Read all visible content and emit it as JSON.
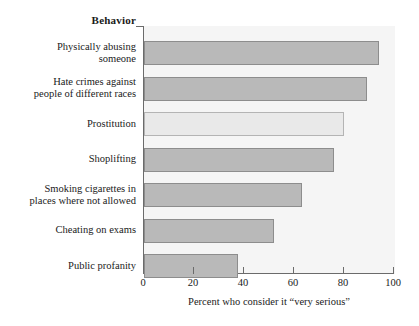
{
  "chart_data": {
    "type": "bar",
    "orientation": "horizontal",
    "title": "",
    "category_axis_title": "Behavior",
    "xlabel": "Percent who consider it “very serious”",
    "ylabel": "Behavior",
    "xlim": [
      0,
      100
    ],
    "xticks": [
      0,
      20,
      40,
      60,
      80,
      100
    ],
    "xtick_labels": [
      "0",
      "20",
      "40",
      "60",
      "80",
      "100"
    ],
    "grid": false,
    "legend": "none",
    "categories": [
      "Physically abusing someone",
      "Hate crimes against people of different races",
      "Prostitution",
      "Shoplifting",
      "Smoking cigarettes in places where not allowed",
      "Cheating on exams",
      "Public profanity"
    ],
    "category_lines": [
      [
        "Physically abusing",
        "someone"
      ],
      [
        "Hate crimes against",
        "people of different races"
      ],
      [
        "Prostitution",
        ""
      ],
      [
        "Shoplifting",
        ""
      ],
      [
        "Smoking cigarettes in",
        "places where not allowed"
      ],
      [
        "Cheating on exams",
        ""
      ],
      [
        "Public profanity",
        ""
      ]
    ],
    "values": [
      94,
      89,
      80,
      76,
      63,
      52,
      37.5
    ],
    "bar_colors": [
      "#b9b9b9",
      "#b9b9b9",
      "#e9e9e9",
      "#b9b9b9",
      "#b9b9b9",
      "#b9b9b9",
      "#b9b9b9"
    ],
    "bar_border_color": "#8d8d8d",
    "plot_background": "#f5f5f5",
    "axis_color": "#6b6b6b"
  },
  "axis": {
    "behavior_label": "Behavior",
    "x_title": "Percent who consider it “very serious”",
    "ticks": [
      "0",
      "20",
      "40",
      "60",
      "80",
      "100"
    ]
  },
  "rows": [
    {
      "line1": "Physically abusing",
      "line2": "someone",
      "value": 94
    },
    {
      "line1": "Hate crimes against",
      "line2": "people of different races",
      "value": 89
    },
    {
      "line1": "Prostitution",
      "line2": "",
      "value": 80
    },
    {
      "line1": "Shoplifting",
      "line2": "",
      "value": 76
    },
    {
      "line1": "Smoking cigarettes in",
      "line2": "places where not allowed",
      "value": 63
    },
    {
      "line1": "Cheating on exams",
      "line2": "",
      "value": 52
    },
    {
      "line1": "Public profanity",
      "line2": "",
      "value": 37.5
    }
  ]
}
